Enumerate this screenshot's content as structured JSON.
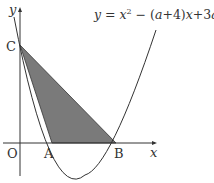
{
  "equation": {
    "lhs": "y",
    "eq": " = ",
    "x1": "x",
    "sup": "2",
    "rest1": " − (",
    "a1": "a",
    "rest2": "+4)",
    "x2": "x",
    "rest3": "+3",
    "a2": "a",
    "rest4": "+3"
  },
  "labels": {
    "origin": "O",
    "x_axis": "x",
    "y_axis": "y",
    "point_a": "A",
    "point_b": "B",
    "point_c": "C"
  },
  "colors": {
    "shade": "#7a7a7a",
    "line": "#333333"
  }
}
